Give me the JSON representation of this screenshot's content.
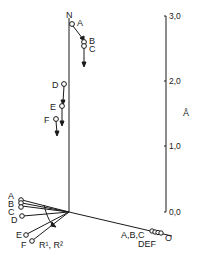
{
  "diagram": {
    "scale": {
      "unit": "Å",
      "ticks": [
        "3,0",
        "2,0",
        "1,0",
        "0,0"
      ]
    },
    "top_cluster": {
      "apex_label": "N",
      "points": [
        "A",
        "B",
        "C"
      ]
    },
    "middle_cluster": {
      "points": [
        "D",
        "E",
        "F"
      ]
    },
    "left_fan": {
      "points": [
        "A",
        "B",
        "C",
        "D",
        "E",
        "F"
      ],
      "arc_label": "R¹, R²"
    },
    "right_ray": {
      "labels": [
        "A,B,C",
        "DEF"
      ],
      "end_label": "O"
    }
  }
}
